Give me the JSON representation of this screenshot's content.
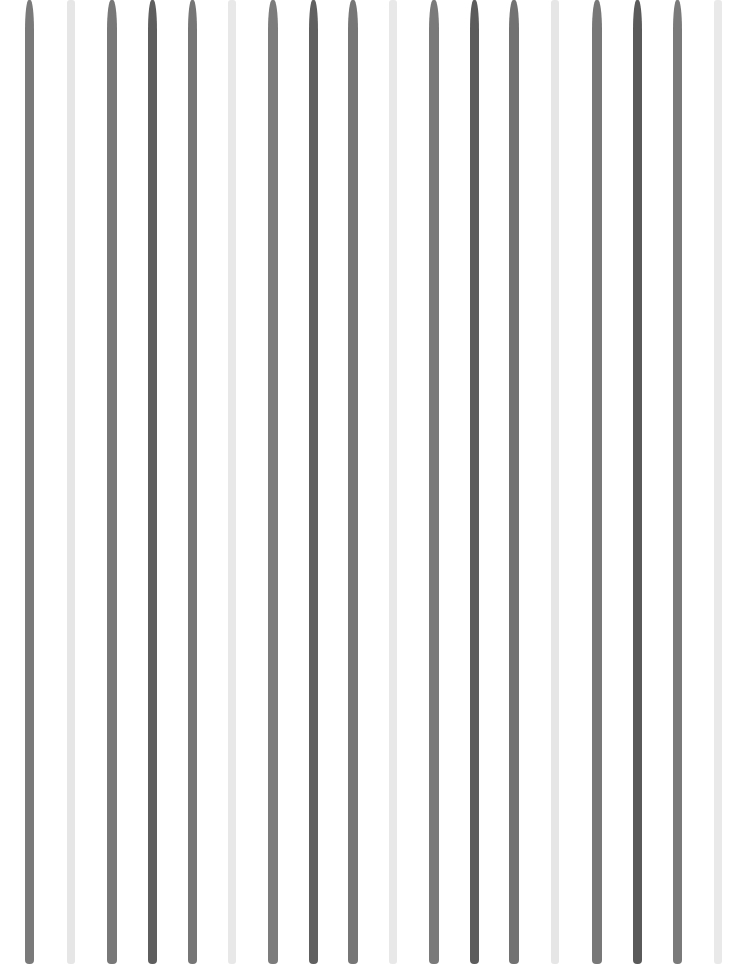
{
  "image": {
    "description": "Vertical painted watercolor-like stripes in varying gray tones on white background",
    "width": 743,
    "height": 964,
    "background": "#ffffff"
  },
  "stripes": [
    {
      "x": 29,
      "w": 9,
      "tone": "medium",
      "color": "#7a7a7a"
    },
    {
      "x": 71,
      "w": 8,
      "tone": "light",
      "color": "#e6e6e6"
    },
    {
      "x": 112,
      "w": 10,
      "tone": "medium",
      "color": "#787878"
    },
    {
      "x": 152,
      "w": 9,
      "tone": "dark",
      "color": "#5e5e5e"
    },
    {
      "x": 192,
      "w": 9,
      "tone": "medium",
      "color": "#767676"
    },
    {
      "x": 232,
      "w": 8,
      "tone": "light",
      "color": "#e8e8e8"
    },
    {
      "x": 273,
      "w": 10,
      "tone": "medium",
      "color": "#7c7c7c"
    },
    {
      "x": 313,
      "w": 9,
      "tone": "dark",
      "color": "#606060"
    },
    {
      "x": 353,
      "w": 10,
      "tone": "medium",
      "color": "#767676"
    },
    {
      "x": 393,
      "w": 8,
      "tone": "light",
      "color": "#e8e8e8"
    },
    {
      "x": 434,
      "w": 10,
      "tone": "medium",
      "color": "#7a7a7a"
    },
    {
      "x": 474,
      "w": 9,
      "tone": "dark",
      "color": "#5c5c5c"
    },
    {
      "x": 514,
      "w": 10,
      "tone": "medium",
      "color": "#727272"
    },
    {
      "x": 555,
      "w": 8,
      "tone": "light",
      "color": "#e6e6e6"
    },
    {
      "x": 597,
      "w": 10,
      "tone": "medium",
      "color": "#787878"
    },
    {
      "x": 637,
      "w": 9,
      "tone": "dark",
      "color": "#5a5a5a"
    },
    {
      "x": 677,
      "w": 9,
      "tone": "medium",
      "color": "#7a7a7a"
    },
    {
      "x": 718,
      "w": 8,
      "tone": "light",
      "color": "#e9e9e9"
    }
  ]
}
